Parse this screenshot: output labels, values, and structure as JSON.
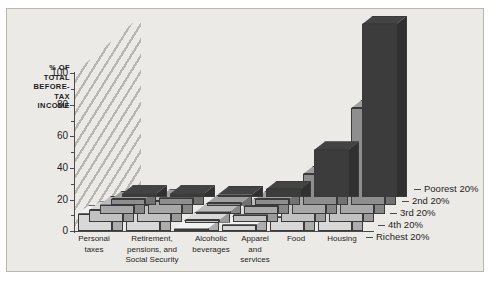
{
  "chart_data": {
    "type": "bar",
    "title": "",
    "subtitle": "",
    "xlabel": "",
    "ylabel": "% OF TOTAL BEFORE-TAX INCOME",
    "ylim": [
      0,
      100
    ],
    "yticks": [
      0,
      20,
      40,
      60,
      80,
      100
    ],
    "yminorticks": [
      10,
      30,
      50,
      70,
      90
    ],
    "grid": false,
    "legend_position": "right",
    "projection": "3d-grouped",
    "categories": [
      "Personal taxes",
      "Retirement, pensions, and Social Security",
      "Alcoholic beverages",
      "Apparel and services",
      "Food",
      "Housing"
    ],
    "series": [
      {
        "name": "Poorest 20%",
        "color": "#3c3c3c",
        "values": [
          2,
          2,
          1,
          5,
          30,
          110
        ]
      },
      {
        "name": "2nd 20%",
        "color": "#8e8e8e",
        "values": [
          4,
          5,
          1,
          4,
          20,
          62
        ]
      },
      {
        "name": "3rd 20%",
        "color": "#a8a8a8",
        "values": [
          6,
          8,
          1,
          5,
          15,
          33
        ]
      },
      {
        "name": "4th 20%",
        "color": "#c2c2c2",
        "values": [
          8,
          11,
          1,
          5,
          12,
          24
        ]
      },
      {
        "name": "Richest 20%",
        "color": "#d8d8d8",
        "values": [
          11,
          14,
          1,
          4,
          9,
          18
        ]
      }
    ]
  },
  "axis": {
    "label_lines": [
      "% OF",
      "TOTAL",
      "BEFORE-",
      "TAX",
      "INCOME"
    ],
    "ticks": [
      "100",
      "80",
      "60",
      "40",
      "20",
      "0"
    ]
  },
  "categories": [
    {
      "lines": [
        "Personal",
        "taxes"
      ]
    },
    {
      "lines": [
        "Retirement,",
        "pensions, and",
        "Social Security"
      ]
    },
    {
      "lines": [
        "Alcoholic",
        "beverages"
      ]
    },
    {
      "lines": [
        "Apparel",
        "and",
        "services"
      ]
    },
    {
      "lines": [
        "Food"
      ]
    },
    {
      "lines": [
        "Housing"
      ]
    }
  ],
  "legend": [
    {
      "label": "Poorest 20%"
    },
    {
      "label": "2nd 20%"
    },
    {
      "label": "3rd 20%"
    },
    {
      "label": "4th 20%"
    },
    {
      "label": "Richest 20%"
    }
  ]
}
